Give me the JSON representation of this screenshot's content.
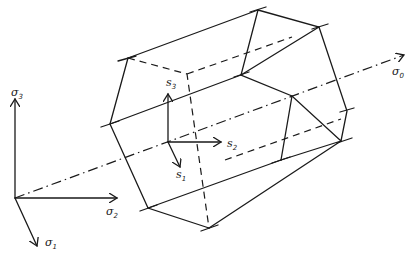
{
  "figure": {
    "principal_axes": [
      {
        "id": "sigma1",
        "symbol": "σ",
        "subscript": "1"
      },
      {
        "id": "sigma2",
        "symbol": "σ",
        "subscript": "2"
      },
      {
        "id": "sigma3",
        "symbol": "σ",
        "subscript": "3"
      }
    ],
    "hydrostatic_axis": {
      "symbol": "σ",
      "subscript": "0"
    },
    "deviatoric_axes": [
      {
        "id": "s1",
        "symbol": "s",
        "subscript": "1"
      },
      {
        "id": "s2",
        "symbol": "s",
        "subscript": "2"
      },
      {
        "id": "s3",
        "symbol": "s",
        "subscript": "3"
      }
    ],
    "line_color": "#1a1a1a",
    "background": "#ffffff"
  }
}
